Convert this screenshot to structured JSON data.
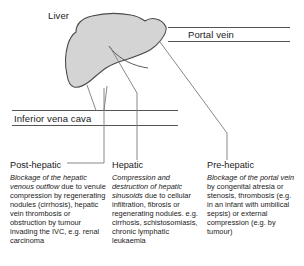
{
  "figure": {
    "labels": {
      "liver": "Liver",
      "portal_vein": "Portal vein",
      "inferior_vena_cava": "Inferior vena cava"
    },
    "colors": {
      "liver_fill": "#d4d4d4",
      "outline": "#4a4a4a",
      "leader_line": "#7a7a7a",
      "rule_line": "#555555",
      "text": "#1a1a1a",
      "background": "#ffffff"
    },
    "notes": [
      {
        "id": "post-hepatic",
        "heading": "Post-hepatic",
        "emphasis": "Blockage of the hepatic venous outflow",
        "body": " due to venule compression by regenerating nodules (cirrhosis), hepatic vein thrombosis or obstruction by tumour invading the IVC, e.g. renal carcinoma"
      },
      {
        "id": "hepatic",
        "heading": "Hepatic",
        "emphasis": "Compression and destruction of hepatic sinusoids",
        "body": " due to cellular infiltration, fibrosis or regenerating nodules. e.g. cirrhosis, schistosomiasis, chronic lymphatic leukaemia"
      },
      {
        "id": "pre-hepatic",
        "heading": "Pre-hepatic",
        "emphasis": "Blockage of the portal vein",
        "body": " by congenital atresia or stenosis, thrombosis (e.g. in an infant with umbilical sepsis) or external compression (e.g. by tumour)"
      }
    ]
  }
}
